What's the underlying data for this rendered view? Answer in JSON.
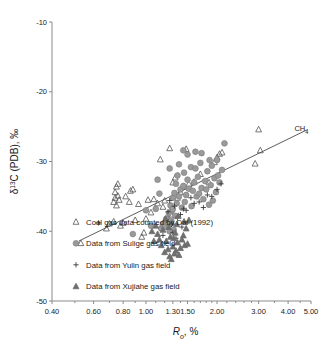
{
  "chart_data": {
    "type": "scatter",
    "title": "",
    "xlabel": "R o , %",
    "xlabel_main": "R",
    "xlabel_sub": "o",
    "xlabel_unit": ", %",
    "ylabel": "δ 13 C (PDB), ‰",
    "ylabel_main": "δ",
    "ylabel_sup": "13",
    "ylabel_rest": "C (PDB), ‰",
    "xscale": "log",
    "yscale": "linear",
    "xlim": [
      0.4,
      5.0
    ],
    "ylim": [
      -50,
      -10
    ],
    "grid": false,
    "xticks": [
      0.4,
      0.6,
      0.8,
      1.0,
      1.3,
      1.5,
      2.0,
      3.0,
      4.0,
      5.0
    ],
    "xticklabels": [
      "0.40",
      "0.60",
      "0.80",
      "1.00",
      "1.30",
      "1.50",
      "2.00",
      "3.00",
      "4.00",
      "5.00"
    ],
    "yticks": [
      -50,
      -40,
      -30,
      -20,
      -10
    ],
    "yticklabels": [
      "-50",
      "-40",
      "-30",
      "-20",
      "-10"
    ],
    "annotations": [
      {
        "text": "CH 4",
        "text_main": "CH",
        "text_sub": "4",
        "x": 4.55,
        "y": -25.6
      }
    ],
    "trendline": {
      "x0": 0.52,
      "y0": -41.4,
      "x1": 4.85,
      "y1": -25.4,
      "label": "CH4"
    },
    "legend_position": "lower-left-inside",
    "series": [
      {
        "name": "Coal gas data counted by Dai (1992)",
        "marker": "open-triangle",
        "color": "#555555",
        "fill": "none",
        "points": [
          [
            0.53,
            -41.7
          ],
          [
            0.68,
            -39.6
          ],
          [
            0.7,
            -38.9
          ],
          [
            0.73,
            -38.6
          ],
          [
            0.73,
            -35.8
          ],
          [
            0.74,
            -35.2
          ],
          [
            0.74,
            -34.4
          ],
          [
            0.75,
            -36.3
          ],
          [
            0.75,
            -33.6
          ],
          [
            0.76,
            -34.9
          ],
          [
            0.76,
            -33.2
          ],
          [
            0.77,
            -35.5
          ],
          [
            0.78,
            -39.2
          ],
          [
            0.8,
            -38.8
          ],
          [
            0.82,
            -35.0
          ],
          [
            0.85,
            -35.8
          ],
          [
            0.86,
            -34.2
          ],
          [
            0.88,
            -34.0
          ],
          [
            0.9,
            -38.4
          ],
          [
            0.93,
            -36.1
          ],
          [
            0.96,
            -40.8
          ],
          [
            0.98,
            -40.2
          ],
          [
            1.0,
            -38.2
          ],
          [
            1.02,
            -35.5
          ],
          [
            1.05,
            -37.3
          ],
          [
            1.08,
            -35.4
          ],
          [
            1.12,
            -36.0
          ],
          [
            1.15,
            -29.7
          ],
          [
            1.18,
            -36.5
          ],
          [
            1.2,
            -35.6
          ],
          [
            1.24,
            -38.0
          ],
          [
            1.26,
            -28.1
          ],
          [
            1.28,
            -37.6
          ],
          [
            1.3,
            -33.0
          ],
          [
            1.33,
            -32.3
          ],
          [
            1.36,
            -35.2
          ],
          [
            1.4,
            -34.4
          ],
          [
            1.45,
            -33.6
          ],
          [
            1.48,
            -28.2
          ],
          [
            1.52,
            -33.2
          ],
          [
            1.6,
            -32.9
          ],
          [
            1.7,
            -31.8
          ],
          [
            1.85,
            -33.0
          ],
          [
            1.95,
            -30.1
          ],
          [
            2.0,
            -29.4
          ],
          [
            2.05,
            -28.9
          ],
          [
            2.1,
            -28.7
          ],
          [
            2.9,
            -30.3
          ],
          [
            3.05,
            -28.4
          ],
          [
            3.0,
            -25.4
          ]
        ]
      },
      {
        "name": "Data from Sulige gas field",
        "marker": "filled-circle",
        "color": "#9a9a9a",
        "fill": "#9a9a9a",
        "points": [
          [
            1.16,
            -39.6
          ],
          [
            1.18,
            -39.0
          ],
          [
            1.2,
            -39.4
          ],
          [
            1.22,
            -38.2
          ],
          [
            1.24,
            -38.8
          ],
          [
            1.25,
            -37.4
          ],
          [
            1.26,
            -40.0
          ],
          [
            1.27,
            -36.3
          ],
          [
            1.28,
            -38.5
          ],
          [
            1.29,
            -37.0
          ],
          [
            1.3,
            -36.8
          ],
          [
            1.3,
            -35.2
          ],
          [
            1.31,
            -39.8
          ],
          [
            1.32,
            -34.5
          ],
          [
            1.33,
            -37.8
          ],
          [
            1.34,
            -33.2
          ],
          [
            1.35,
            -36.0
          ],
          [
            1.36,
            -32.0
          ],
          [
            1.38,
            -35.0
          ],
          [
            1.4,
            -34.0
          ],
          [
            1.42,
            -36.6
          ],
          [
            1.44,
            -33.5
          ],
          [
            1.45,
            -31.6
          ],
          [
            1.46,
            -35.8
          ],
          [
            1.48,
            -34.8
          ],
          [
            1.5,
            -32.6
          ],
          [
            1.52,
            -33.9
          ],
          [
            1.55,
            -30.8
          ],
          [
            1.56,
            -36.4
          ],
          [
            1.58,
            -34.2
          ],
          [
            1.6,
            -33.0
          ],
          [
            1.62,
            -31.0
          ],
          [
            1.64,
            -35.0
          ],
          [
            1.66,
            -32.2
          ],
          [
            1.68,
            -34.6
          ],
          [
            1.7,
            -30.2
          ],
          [
            1.72,
            -33.8
          ],
          [
            1.75,
            -35.4
          ],
          [
            1.78,
            -32.8
          ],
          [
            1.8,
            -34.0
          ],
          [
            1.82,
            -31.4
          ],
          [
            1.85,
            -36.2
          ],
          [
            1.88,
            -33.4
          ],
          [
            1.9,
            -30.6
          ],
          [
            1.92,
            -35.6
          ],
          [
            1.95,
            -32.4
          ],
          [
            1.98,
            -34.4
          ],
          [
            2.0,
            -29.8
          ],
          [
            2.05,
            -33.0
          ],
          [
            2.1,
            -31.2
          ],
          [
            2.15,
            -27.4
          ],
          [
            1.1,
            -36.8
          ],
          [
            1.12,
            -32.6
          ],
          [
            1.14,
            -34.6
          ],
          [
            1.05,
            -39.2
          ],
          [
            1.26,
            -31.0
          ],
          [
            1.38,
            -30.4
          ],
          [
            1.5,
            -29.0
          ],
          [
            1.44,
            -28.4
          ],
          [
            1.72,
            -28.8
          ],
          [
            0.88,
            -40.4
          ],
          [
            1.0,
            -37.0
          ],
          [
            2.02,
            -32.0
          ],
          [
            1.86,
            -29.8
          ],
          [
            1.62,
            -28.6
          ]
        ]
      },
      {
        "name": "Data from Yulin gas field",
        "marker": "plus",
        "color": "#3a3a3a",
        "fill": "none",
        "points": [
          [
            0.63,
            -38.8
          ],
          [
            1.18,
            -40.6
          ],
          [
            1.22,
            -38.4
          ],
          [
            1.24,
            -37.2
          ],
          [
            1.28,
            -39.0
          ],
          [
            1.3,
            -40.2
          ],
          [
            1.32,
            -36.4
          ],
          [
            1.36,
            -38.0
          ],
          [
            1.4,
            -37.6
          ],
          [
            1.44,
            -36.8
          ],
          [
            1.48,
            -37.0
          ],
          [
            1.55,
            -35.2
          ],
          [
            1.6,
            -36.0
          ],
          [
            1.68,
            -35.8
          ],
          [
            1.75,
            -36.6
          ],
          [
            1.82,
            -34.8
          ],
          [
            1.9,
            -35.0
          ],
          [
            2.0,
            -34.0
          ],
          [
            2.08,
            -33.2
          ],
          [
            1.34,
            -41.0
          ],
          [
            1.42,
            -39.4
          ],
          [
            1.52,
            -38.6
          ],
          [
            1.26,
            -35.6
          ]
        ]
      },
      {
        "name": "Data from Xujiahe gas field",
        "marker": "filled-triangle",
        "color": "#6e6e6e",
        "fill": "#6e6e6e",
        "points": [
          [
            1.16,
            -42.0
          ],
          [
            1.2,
            -43.0
          ],
          [
            1.22,
            -41.4
          ],
          [
            1.24,
            -42.6
          ],
          [
            1.26,
            -43.6
          ],
          [
            1.27,
            -40.8
          ],
          [
            1.28,
            -44.0
          ],
          [
            1.3,
            -42.2
          ],
          [
            1.31,
            -41.0
          ],
          [
            1.32,
            -43.2
          ],
          [
            1.33,
            -40.2
          ],
          [
            1.34,
            -42.8
          ],
          [
            1.36,
            -41.6
          ],
          [
            1.38,
            -43.4
          ],
          [
            1.4,
            -42.4
          ],
          [
            1.42,
            -41.2
          ],
          [
            1.44,
            -40.6
          ],
          [
            1.46,
            -42.0
          ],
          [
            1.48,
            -39.6
          ],
          [
            1.5,
            -41.8
          ],
          [
            1.12,
            -40.4
          ],
          [
            1.14,
            -41.2
          ],
          [
            1.18,
            -39.8
          ],
          [
            1.25,
            -39.4
          ],
          [
            1.35,
            -39.0
          ],
          [
            1.45,
            -38.6
          ],
          [
            1.29,
            -38.8
          ],
          [
            1.21,
            -38.2
          ],
          [
            1.37,
            -37.8
          ],
          [
            1.1,
            -39.2
          ],
          [
            1.52,
            -38.4
          ],
          [
            1.06,
            -40.0
          ],
          [
            1.08,
            -41.4
          ]
        ]
      }
    ]
  },
  "legend": {
    "items": [
      {
        "marker": "open-triangle",
        "label": "Coal gas data counted by Dai (1992)"
      },
      {
        "marker": "filled-circle",
        "label": "Data from Sulige gas field"
      },
      {
        "marker": "plus",
        "label": "Data from Yulin gas field"
      },
      {
        "marker": "filled-triangle",
        "label": "Data from Xujiahe gas field"
      }
    ]
  },
  "colors": {
    "axis": "#8a8a8a",
    "text": "#1a1a1a",
    "circle_gray": "#9a9a9a",
    "triangle_gray": "#6e6e6e",
    "trend": "#4a4a4a"
  }
}
